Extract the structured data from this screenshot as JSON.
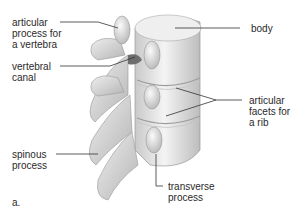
{
  "figure": {
    "panel_label": "a."
  },
  "labels": {
    "articular_process": "articular\nprocess for\na vertebra",
    "vertebral_canal": "vertebral\ncanal",
    "spinous_process": "spinous\nprocess",
    "body": "body",
    "articular_facets": "articular\nfacets for\na rib",
    "transverse_process": "transverse\nprocess"
  },
  "colors": {
    "bone_light": "#f2f2f2",
    "bone_mid": "#d6d6d6",
    "bone_shadow": "#a8a8a8",
    "leader_line": "#333333",
    "text": "#2a2a2a"
  }
}
